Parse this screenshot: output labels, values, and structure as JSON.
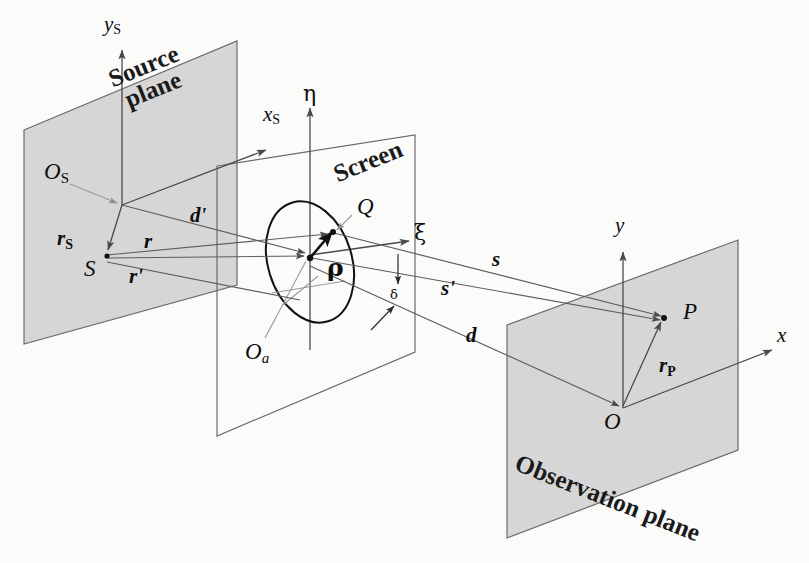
{
  "figure": {
    "kind": "three-plane diffraction geometry diagram",
    "planes": {
      "source": {
        "title_line1": "Source",
        "title_line2": "plane"
      },
      "screen": {
        "title": "Screen"
      },
      "observation": {
        "title": "Observation plane"
      }
    },
    "axes": [
      {
        "name": "y-source-axis",
        "label": "y",
        "sub": "S"
      },
      {
        "name": "x-source-axis",
        "label": "x",
        "sub": "S"
      },
      {
        "name": "eta-axis",
        "label": "η"
      },
      {
        "name": "xi-axis",
        "label": "ξ"
      },
      {
        "name": "y-axis",
        "label": "y"
      },
      {
        "name": "x-axis",
        "label": "x"
      }
    ],
    "points": [
      {
        "name": "origin-source",
        "label": "O",
        "sub": "S"
      },
      {
        "name": "source-point",
        "label": "S"
      },
      {
        "name": "aperture-point",
        "label": "Q"
      },
      {
        "name": "aperture-origin",
        "label": "O",
        "sub": "a"
      },
      {
        "name": "observation-point",
        "label": "P"
      },
      {
        "name": "origin-observation",
        "label": "O"
      }
    ],
    "vectors": [
      {
        "name": "vector-rS",
        "label": "r",
        "sub": "S"
      },
      {
        "name": "vector-r",
        "label": "r"
      },
      {
        "name": "vector-r-prime",
        "label": "r'"
      },
      {
        "name": "vector-d-prime",
        "label": "d'"
      },
      {
        "name": "vector-rho",
        "label": "ρ"
      },
      {
        "name": "vector-s",
        "label": "s"
      },
      {
        "name": "vector-s-prime",
        "label": "s'"
      },
      {
        "name": "vector-d",
        "label": "d"
      },
      {
        "name": "vector-rP",
        "label": "r",
        "sub": "P"
      }
    ],
    "annotations": [
      {
        "name": "delta-annotation",
        "label": "δ"
      }
    ],
    "colors": {
      "plane_fill": "#d2d2d2",
      "plane_stroke": "#6a6a6a",
      "line": "#5d5d5d",
      "accent_dark": "#111111",
      "faint_line": "#9a9a9a",
      "background": "#fbfbfa"
    }
  }
}
